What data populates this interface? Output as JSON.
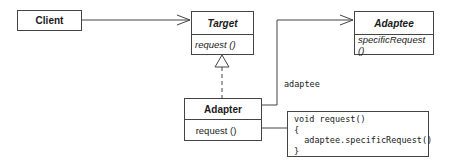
{
  "diagram": {
    "classes": {
      "client": {
        "name": "Client",
        "operations": []
      },
      "target": {
        "name": "Target",
        "abstract": true,
        "operations": [
          "request ()"
        ]
      },
      "adaptee": {
        "name": "Adaptee",
        "abstract": true,
        "operations": [
          "specificRequest ()"
        ]
      },
      "adapter": {
        "name": "Adapter",
        "abstract": false,
        "operations": [
          "request ()"
        ]
      }
    },
    "association_label": "adaptee",
    "note": {
      "lines": [
        "void request()",
        "{",
        "  adaptee.specificRequest()",
        "}"
      ]
    },
    "relationships": [
      {
        "from": "Client",
        "to": "Target",
        "type": "association"
      },
      {
        "from": "Adapter",
        "to": "Target",
        "type": "realization"
      },
      {
        "from": "Adapter",
        "to": "Adaptee",
        "type": "association",
        "label": "adaptee"
      },
      {
        "from": "Adapter.request",
        "to": "note",
        "type": "note-link"
      }
    ],
    "colors": {
      "line": "#444444",
      "text": "#1a1a1a",
      "background": "#ffffff"
    }
  }
}
